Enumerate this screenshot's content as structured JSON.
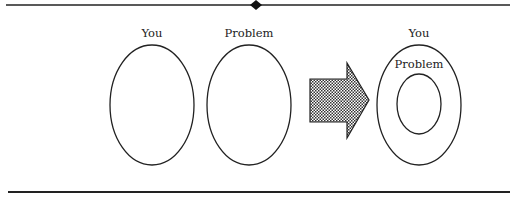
{
  "diagram": {
    "left_group": {
      "you_label": "You",
      "problem_label": "Problem"
    },
    "right_group": {
      "you_label": "You",
      "problem_label": "Problem"
    },
    "arrow": {
      "style": "dotted-fill",
      "direction": "right"
    },
    "colors": {
      "stroke": "#222222",
      "background": "#ffffff"
    }
  }
}
